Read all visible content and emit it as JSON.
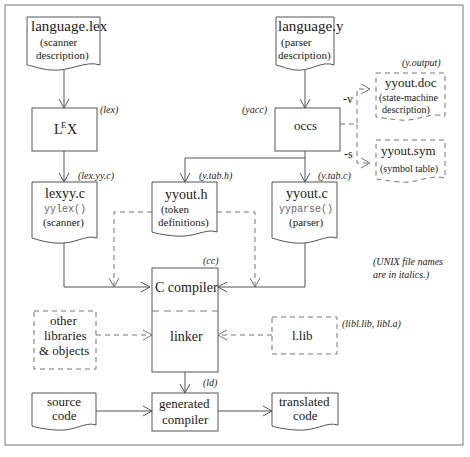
{
  "diagram": {
    "nodes": {
      "language_lex": {
        "title": "language.lex",
        "line1": "(scanner",
        "line2": "description)"
      },
      "language_y": {
        "title": "language.y",
        "line1": "(parser",
        "line2": "description)"
      },
      "lex_tool": {
        "title_L": "L",
        "title_E": "E",
        "title_X": "X",
        "file": "(lex)"
      },
      "occs": {
        "title": "occs",
        "file": "(yacc)"
      },
      "yyout_doc": {
        "title": "yyout.doc",
        "line1": "(state-machine",
        "line2": "description)",
        "file": "(y.output)"
      },
      "yyout_sym": {
        "title": "yyout.sym",
        "line1": "(symbol table)"
      },
      "lexyy_c": {
        "title": "lexyy.c",
        "code": "yylex()",
        "line1": "(scanner)",
        "file": "(lex.yy.c)"
      },
      "yyout_h": {
        "title": "yyout.h",
        "line1": "(token",
        "line2": "definitions)",
        "file": "(y.tab.h)"
      },
      "yyout_c": {
        "title": "yyout.c",
        "code": "yyparse()",
        "line1": "(parser)",
        "file": "(y.tab.c)"
      },
      "c_compiler": {
        "title": "C compiler",
        "file": "(cc)"
      },
      "linker": {
        "title": "linker",
        "file": "(ld)"
      },
      "other_libs": {
        "line1": "other",
        "line2": "libraries",
        "line3": "& objects"
      },
      "l_lib": {
        "title": "l.lib",
        "file": "(libl.lib, libl.a)"
      },
      "source_code": {
        "line1": "source",
        "line2": "code"
      },
      "generated_compiler": {
        "line1": "generated",
        "line2": "compiler"
      },
      "translated_code": {
        "line1": "translated",
        "line2": "code"
      }
    },
    "edge_labels": {
      "v_flag": "-v",
      "s_flag": "-s"
    },
    "note": {
      "line1": "(UNIX file names",
      "line2": "are in italics.)"
    }
  }
}
